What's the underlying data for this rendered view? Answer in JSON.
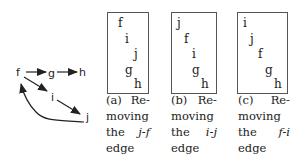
{
  "graph": {
    "nodes": [
      {
        "id": "f",
        "label": "f"
      },
      {
        "id": "g",
        "label": "g"
      },
      {
        "id": "h",
        "label": "h"
      },
      {
        "id": "i",
        "label": "i"
      },
      {
        "id": "j",
        "label": "j"
      }
    ],
    "edges": [
      {
        "from": "f",
        "to": "g"
      },
      {
        "from": "g",
        "to": "h"
      },
      {
        "from": "f",
        "to": "i"
      },
      {
        "from": "i",
        "to": "j"
      },
      {
        "from": "j",
        "to": "f",
        "curved": true
      }
    ]
  },
  "panels": [
    {
      "order": [
        "f",
        "i",
        "j",
        "g",
        "h"
      ],
      "caption": {
        "tag": "(a)",
        "w1": "Re-",
        "w2": "moving",
        "w3": "the",
        "edge": "j-f",
        "w4": "edge"
      }
    },
    {
      "order": [
        "j",
        "f",
        "i",
        "g",
        "h"
      ],
      "caption": {
        "tag": "(b)",
        "w1": "Re-",
        "w2": "moving",
        "w3": "the",
        "edge": "i-j",
        "w4": "edge"
      }
    },
    {
      "order": [
        "i",
        "j",
        "f",
        "g",
        "h"
      ],
      "caption": {
        "tag": "(c)",
        "w1": "Re-",
        "w2": "moving",
        "w3": "the",
        "edge": "f-i",
        "w4": "edge"
      }
    }
  ]
}
